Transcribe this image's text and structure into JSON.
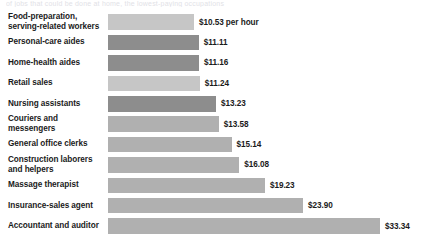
{
  "top_bleed_text": "of jobs that could be done at home, the lowest-paying occupations",
  "chart_data": {
    "type": "bar",
    "orientation": "horizontal",
    "title": "",
    "subtitle": "",
    "xlabel": "",
    "ylabel": "",
    "unit": "per hour",
    "xlim": [
      0,
      33.34
    ],
    "grid": false,
    "legend": null,
    "categories": [
      "Food-preparation, serving-related workers",
      "Personal-care aides",
      "Home-health aides",
      "Retail sales",
      "Nursing assistants",
      "Couriers and messengers",
      "General office clerks",
      "Construction laborers and helpers",
      "Massage therapist",
      "Insurance-sales agent",
      "Accountant and auditor"
    ],
    "values": [
      10.53,
      11.11,
      11.16,
      11.24,
      13.23,
      13.58,
      15.14,
      16.08,
      19.23,
      23.9,
      33.34
    ],
    "value_labels": [
      "$10.53 per hour",
      "$11.11",
      "$11.16",
      "$11.24",
      "$13.23",
      "$13.58",
      "$15.14",
      "$16.08",
      "$19.23",
      "$23.90",
      "$33.34"
    ],
    "bar_colors": [
      "#c6c6c6",
      "#8d8d8d",
      "#8d8d8d",
      "#c6c6c6",
      "#8d8d8d",
      "#b0b0b0",
      "#b0b0b0",
      "#b0b0b0",
      "#b0b0b0",
      "#b0b0b0",
      "#b0b0b0"
    ],
    "rows": [
      {
        "label_line1": "Food-preparation,",
        "label_line2": "serving-related workers",
        "value": 10.53,
        "value_label": "$10.53 per hour",
        "color": "#c6c6c6"
      },
      {
        "label_line1": "Personal-care aides",
        "label_line2": "",
        "value": 11.11,
        "value_label": "$11.11",
        "color": "#8d8d8d"
      },
      {
        "label_line1": "Home-health aides",
        "label_line2": "",
        "value": 11.16,
        "value_label": "$11.16",
        "color": "#8d8d8d"
      },
      {
        "label_line1": "Retail sales",
        "label_line2": "",
        "value": 11.24,
        "value_label": "$11.24",
        "color": "#c6c6c6"
      },
      {
        "label_line1": "Nursing assistants",
        "label_line2": "",
        "value": 13.23,
        "value_label": "$13.23",
        "color": "#8d8d8d"
      },
      {
        "label_line1": "Couriers and messengers",
        "label_line2": "",
        "value": 13.58,
        "value_label": "$13.58",
        "color": "#b0b0b0"
      },
      {
        "label_line1": "General office clerks",
        "label_line2": "",
        "value": 15.14,
        "value_label": "$15.14",
        "color": "#b0b0b0"
      },
      {
        "label_line1": "Construction laborers",
        "label_line2": "and helpers",
        "value": 16.08,
        "value_label": "$16.08",
        "color": "#b0b0b0"
      },
      {
        "label_line1": "Massage therapist",
        "label_line2": "",
        "value": 19.23,
        "value_label": "$19.23",
        "color": "#b0b0b0"
      },
      {
        "label_line1": "Insurance-sales agent",
        "label_line2": "",
        "value": 23.9,
        "value_label": "$23.90",
        "color": "#b0b0b0"
      },
      {
        "label_line1": "Accountant and auditor",
        "label_line2": "",
        "value": 33.34,
        "value_label": "$33.34",
        "color": "#b0b0b0"
      }
    ]
  },
  "layout": {
    "bar_origin_x": 114,
    "bar_max_x": 386,
    "row_height": 20.4,
    "bar_height": 15.5,
    "rows_top": 12
  }
}
